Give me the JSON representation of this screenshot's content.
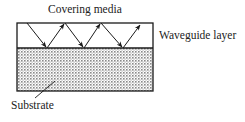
{
  "diagram": {
    "labels": {
      "covering_media": "Covering media",
      "waveguide_layer": "Waveguide layer",
      "substrate": "Substrate"
    },
    "colors": {
      "line": "#1a1a1a",
      "substrate_fill": "#cfcfcf",
      "substrate_dots": "#7a7a7a",
      "background": "#ffffff"
    },
    "geometry": {
      "box": {
        "x": 17,
        "y": 23,
        "width": 136,
        "height": 68
      },
      "waveguide_substrate_boundary_y": 48,
      "ray_points": [
        [
          27,
          23
        ],
        [
          47,
          48
        ],
        [
          65,
          23
        ],
        [
          84,
          48
        ],
        [
          101,
          23
        ],
        [
          123,
          48
        ],
        [
          141,
          24
        ]
      ]
    }
  }
}
